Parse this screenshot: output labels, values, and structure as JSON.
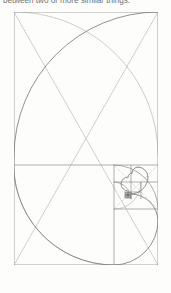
{
  "document": {
    "caption_fragment": "between two or more similar things.",
    "figure_title": "Golden ratio Fibonacci spiral construction"
  },
  "colors": {
    "page_background": "#fdfdfc",
    "caption_text": "#5d5d5d",
    "solid_line": "#8c8c8c",
    "dotted_line": "#9a9a9a",
    "spiral_line": "#7d7d7d",
    "small_square_line": "#6e6e6e"
  },
  "figure": {
    "name": "golden-ratio-spiral",
    "outer_rect": {
      "x": 14,
      "y": 12,
      "width": 144,
      "height": 253
    },
    "divider_y": 165,
    "square_sequence": [
      {
        "label": "square-1",
        "x": 14,
        "y": 12,
        "size": 144
      },
      {
        "label": "square-2",
        "x": 14,
        "y": 165,
        "size": 100
      },
      {
        "label": "square-3",
        "x": 114,
        "y": 165,
        "size": 44
      },
      {
        "label": "square-4",
        "x": 114,
        "y": 209,
        "size": 27
      },
      {
        "label": "square-5",
        "x": 114,
        "y": 182,
        "size": 17
      },
      {
        "label": "square-6",
        "x": 131,
        "y": 182,
        "size": 10
      },
      {
        "label": "square-7",
        "x": 131,
        "y": 192,
        "size": 6
      },
      {
        "label": "square-8",
        "x": 125,
        "y": 192,
        "size": 4
      }
    ],
    "spiral_type": "fibonacci-quarter-arcs",
    "construction_lines": {
      "diagonals": [
        {
          "label": "diagonal-main",
          "x1": 14,
          "y1": 12,
          "x2": 158,
          "y2": 265
        },
        {
          "label": "diagonal-cross",
          "x1": 158,
          "y1": 12,
          "x2": 14,
          "y2": 265
        }
      ],
      "style": "dotted"
    },
    "arcs": {
      "large_spiral_style": "solid",
      "construction_arc_style": "dotted"
    }
  }
}
